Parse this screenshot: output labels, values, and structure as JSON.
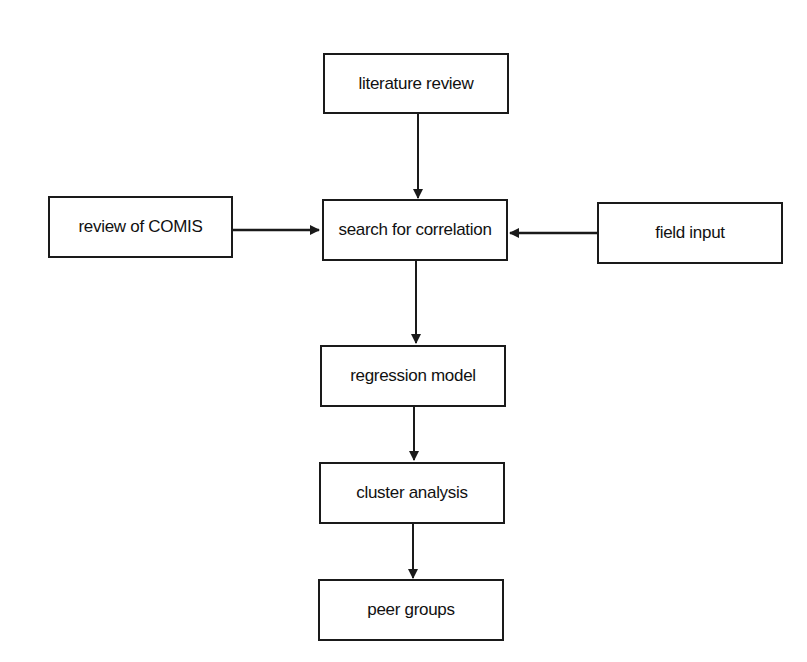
{
  "diagram": {
    "type": "flowchart",
    "nodes": [
      {
        "id": "literature",
        "label": "literature review"
      },
      {
        "id": "comis",
        "label": "review of COMIS"
      },
      {
        "id": "search",
        "label": "search for correlation"
      },
      {
        "id": "field",
        "label": "field input"
      },
      {
        "id": "regression",
        "label": "regression model"
      },
      {
        "id": "cluster",
        "label": "cluster analysis"
      },
      {
        "id": "peer",
        "label": "peer groups"
      }
    ],
    "edges": [
      {
        "from": "literature",
        "to": "search"
      },
      {
        "from": "comis",
        "to": "search"
      },
      {
        "from": "field",
        "to": "search"
      },
      {
        "from": "search",
        "to": "regression"
      },
      {
        "from": "regression",
        "to": "cluster"
      },
      {
        "from": "cluster",
        "to": "peer"
      }
    ]
  }
}
